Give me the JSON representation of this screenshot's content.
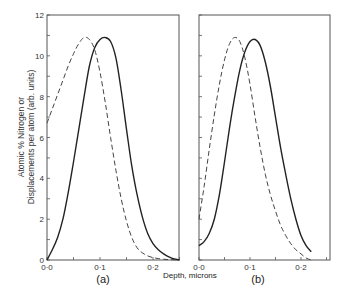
{
  "chart_data": [
    {
      "type": "line",
      "panel_label": "(a)",
      "xlabel": "Depth, microns",
      "ylabel": "Atomic % Nitrogen or Displacements per atom (arb. units)",
      "xlim": [
        0,
        0.25
      ],
      "ylim": [
        0,
        12
      ],
      "x_ticks": [
        "0·0",
        "0·1",
        "0·2"
      ],
      "y_ticks": [
        "0",
        "2",
        "4",
        "6",
        "8",
        "10",
        "12"
      ],
      "grid": false,
      "series": [
        {
          "name": "solid",
          "style": "solid",
          "x": [
            0.0,
            0.01,
            0.02,
            0.03,
            0.04,
            0.05,
            0.06,
            0.07,
            0.08,
            0.09,
            0.1,
            0.11,
            0.12,
            0.13,
            0.14,
            0.15,
            0.16,
            0.17,
            0.18,
            0.19,
            0.2,
            0.21,
            0.22,
            0.23,
            0.24,
            0.25
          ],
          "y": [
            0.0,
            0.5,
            1.1,
            2.0,
            3.3,
            4.8,
            6.4,
            8.0,
            9.5,
            10.4,
            10.8,
            10.9,
            10.7,
            9.9,
            8.3,
            6.4,
            4.6,
            3.2,
            2.1,
            1.3,
            0.8,
            0.5,
            0.3,
            0.15,
            0.05,
            0.0
          ]
        },
        {
          "name": "dashed",
          "style": "dashed",
          "x": [
            0.0,
            0.01,
            0.02,
            0.03,
            0.04,
            0.05,
            0.06,
            0.07,
            0.08,
            0.09,
            0.1,
            0.11,
            0.12,
            0.13,
            0.14,
            0.15,
            0.16,
            0.17,
            0.18,
            0.19,
            0.2,
            0.21,
            0.22,
            0.23,
            0.24,
            0.25
          ],
          "y": [
            6.7,
            7.4,
            8.1,
            8.8,
            9.5,
            10.1,
            10.6,
            10.9,
            10.8,
            10.3,
            9.2,
            7.7,
            6.0,
            4.4,
            3.0,
            1.9,
            1.1,
            0.6,
            0.35,
            0.2,
            0.12,
            0.07,
            0.04,
            0.02,
            0.01,
            0.0
          ]
        }
      ]
    },
    {
      "type": "line",
      "panel_label": "(b)",
      "xlabel": "Depth, microns",
      "xlim": [
        0,
        0.26
      ],
      "ylim": [
        0,
        12
      ],
      "x_ticks": [
        "0·0",
        "0·1",
        "0·2"
      ],
      "grid": false,
      "series": [
        {
          "name": "solid",
          "style": "solid",
          "x": [
            0.0,
            0.01,
            0.02,
            0.03,
            0.04,
            0.05,
            0.06,
            0.07,
            0.08,
            0.09,
            0.1,
            0.11,
            0.12,
            0.13,
            0.14,
            0.15,
            0.16,
            0.17,
            0.18,
            0.19,
            0.2,
            0.21,
            0.22
          ],
          "y": [
            0.7,
            0.9,
            1.3,
            2.0,
            3.2,
            4.8,
            6.5,
            8.0,
            9.3,
            10.2,
            10.7,
            10.8,
            10.5,
            9.7,
            8.5,
            7.0,
            5.5,
            4.2,
            3.0,
            2.0,
            1.2,
            0.7,
            0.4
          ]
        },
        {
          "name": "dashed",
          "style": "dashed",
          "x": [
            0.0,
            0.01,
            0.02,
            0.03,
            0.04,
            0.05,
            0.06,
            0.07,
            0.08,
            0.09,
            0.1,
            0.11,
            0.12,
            0.13,
            0.14,
            0.15,
            0.16,
            0.17,
            0.18,
            0.19,
            0.2,
            0.21,
            0.22
          ],
          "y": [
            2.0,
            3.6,
            5.4,
            7.1,
            8.6,
            9.8,
            10.6,
            10.9,
            10.7,
            9.9,
            8.6,
            7.0,
            5.5,
            4.2,
            3.2,
            2.4,
            1.7,
            1.2,
            0.8,
            0.5,
            0.3,
            0.1,
            0.0
          ]
        }
      ]
    }
  ],
  "figure": {
    "ylabel_line1": "Atomic % Nitrogen or",
    "ylabel_line2": "Displacements per atom (arb. units)",
    "xlabel": "Depth, microns",
    "panel_a": "(a)",
    "panel_b": "(b)",
    "caption": "Figure 5.5"
  }
}
